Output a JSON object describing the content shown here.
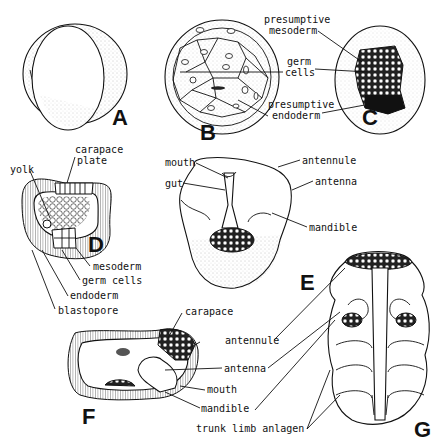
{
  "figure": {
    "panels": [
      {
        "id": "A",
        "letter": "A",
        "labels": []
      },
      {
        "id": "B",
        "letter": "B",
        "labels": []
      },
      {
        "id": "C",
        "letter": "C",
        "labels": [
          "presumptive",
          "mesoderm",
          "germ",
          "cells",
          "presumptive",
          "endoderm"
        ]
      },
      {
        "id": "D",
        "letter": "D",
        "labels": [
          "yolk",
          "carapace",
          "plate",
          "mesoderm",
          "germ cells",
          "endoderm",
          "blastopore"
        ]
      },
      {
        "id": "E",
        "letter": "E",
        "labels": [
          "mouth",
          "gut",
          "antennule",
          "antenna",
          "mandible"
        ]
      },
      {
        "id": "F",
        "letter": "F",
        "labels": [
          "carapace"
        ]
      },
      {
        "id": "G",
        "letter": "G",
        "labels": [
          "antennule",
          "antenna",
          "mouth",
          "mandible",
          "trunk limb anlagen"
        ]
      }
    ]
  },
  "labels": {
    "c_presumptive_meso_1": "presumptive",
    "c_presumptive_meso_2": "mesoderm",
    "c_germ_1": "germ",
    "c_germ_2": "cells",
    "c_presumptive_endo_1": "presumptive",
    "c_presumptive_endo_2": "endoderm",
    "d_yolk": "yolk",
    "d_carapace_1": "carapace",
    "d_carapace_2": "plate",
    "d_mesoderm": "mesoderm",
    "d_germ_cells": "germ cells",
    "d_endoderm": "endoderm",
    "d_blastopore": "blastopore",
    "e_mouth": "mouth",
    "e_gut": "gut",
    "e_antennule": "antennule",
    "e_antenna": "antenna",
    "e_mandible": "mandible",
    "f_carapace": "carapace",
    "fg_antennule": "antennule",
    "fg_antenna": "antenna",
    "fg_mouth": "mouth",
    "fg_mandible": "mandible",
    "g_trunk": "trunk limb anlagen"
  }
}
